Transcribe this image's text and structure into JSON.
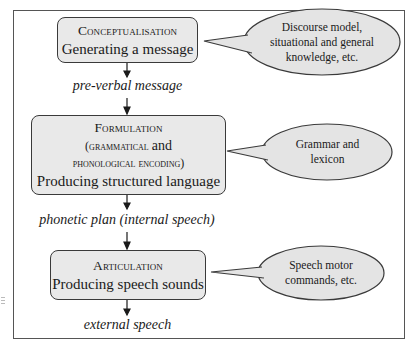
{
  "diagram": {
    "stages": [
      {
        "id": "conceptualisation",
        "title": "Conceptualisation",
        "description": "Generating a message",
        "callout": "Discourse model, situational and general knowledge, etc.",
        "callout_lines": [
          "Discourse model,",
          "situational and general",
          "knowledge, etc."
        ]
      },
      {
        "id": "formulation",
        "title": "Formulation",
        "subtitle_open": "(grammatical",
        "subtitle_and": "and",
        "subtitle_line2": "phonological encoding)",
        "description": "Producing structured language",
        "callout": "Grammar and lexicon",
        "callout_lines": [
          "Grammar and",
          "lexicon"
        ]
      },
      {
        "id": "articulation",
        "title": "Articulation",
        "description": "Producing speech sounds",
        "callout": "Speech motor commands, etc.",
        "callout_lines": [
          "Speech motor",
          "commands, etc."
        ]
      }
    ],
    "outputs": [
      {
        "id": "preverbal",
        "label": "pre-verbal message"
      },
      {
        "id": "phonetic",
        "label": "phonetic plan (internal speech)"
      },
      {
        "id": "external",
        "label": "external speech"
      }
    ],
    "colors": {
      "box_fill": "#e9e9e9",
      "ellipse_fill": "#e4e4e4",
      "stroke": "#3a3a3a",
      "frame": "#555555"
    }
  }
}
